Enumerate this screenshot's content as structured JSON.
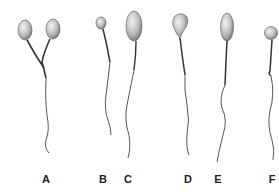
{
  "figure": {
    "colors": {
      "head_light": "#eeeeee",
      "head_dark": "#6e6e6e",
      "tail": "#333333",
      "label": "#222222"
    },
    "specimens": [
      {
        "id": "A",
        "label": "A",
        "label_x": 46,
        "type": "double-headed"
      },
      {
        "id": "B",
        "label": "B",
        "label_x": 103,
        "type": "small head"
      },
      {
        "id": "C",
        "label": "C",
        "label_x": 128,
        "type": "large head"
      },
      {
        "id": "D",
        "label": "D",
        "label_x": 188,
        "type": "pear-shaped head"
      },
      {
        "id": "E",
        "label": "E",
        "label_x": 218,
        "type": "elongated head"
      },
      {
        "id": "F",
        "label": "F",
        "label_x": 272,
        "type": "round head, bent midpiece"
      }
    ]
  }
}
